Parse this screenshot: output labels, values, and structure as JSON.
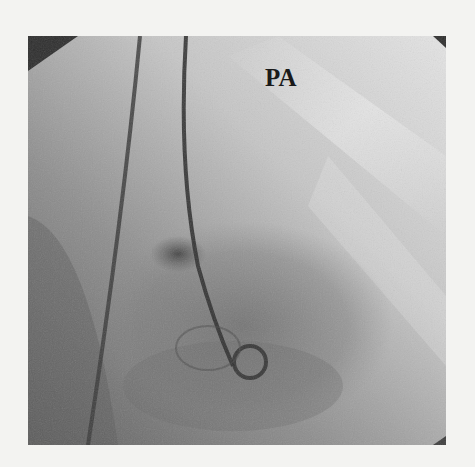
{
  "figure": {
    "type": "fluoroscopy-angiogram",
    "view_label": "PA",
    "colors": {
      "page_background": "#f3f3f1",
      "image_dark": "#4a4a4a",
      "image_mid": "#8a8a8a",
      "image_light": "#dcdcdc",
      "label_text": "#1a1a1a"
    }
  }
}
